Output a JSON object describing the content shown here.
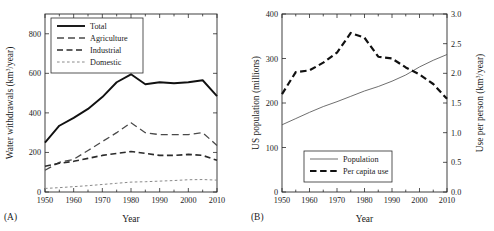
{
  "figure": {
    "panel_a_label": "(A)",
    "panel_b_label": "(B)"
  },
  "chart_data": [
    {
      "type": "line",
      "panel": "A",
      "title": "",
      "xlabel": "Year",
      "ylabel": "Water withdrawals (km3/year)",
      "ylabel_base": "Water withdrawals (km",
      "ylabel_sup": "3",
      "ylabel_tail": "/year)",
      "xlim": [
        1950,
        2010
      ],
      "ylim": [
        0,
        900
      ],
      "xticks": [
        1950,
        1960,
        1970,
        1980,
        1990,
        2000,
        2010
      ],
      "xticklabels": [
        "1950",
        "1960",
        "1970",
        "1980",
        "1990",
        "2000",
        "2010"
      ],
      "xminorticks": [
        1955,
        1965,
        1975,
        1985,
        1995,
        2005
      ],
      "yticks": [
        0,
        200,
        400,
        600,
        800
      ],
      "yticklabels": [
        "0",
        "200",
        "400",
        "600",
        "800"
      ],
      "grid": false,
      "legend_position": "upper-left",
      "x": [
        1950,
        1955,
        1960,
        1965,
        1970,
        1975,
        1980,
        1985,
        1990,
        1995,
        2000,
        2005,
        2010
      ],
      "series": [
        {
          "name": "Total",
          "style": "solid",
          "width": 1.9,
          "color": "#111111",
          "values": [
            250,
            335,
            375,
            420,
            480,
            555,
            595,
            545,
            555,
            550,
            555,
            565,
            485
          ]
        },
        {
          "name": "Agriculture",
          "style": "long-dash",
          "width": 1.3,
          "color": "#4a4a4a",
          "values": [
            110,
            150,
            165,
            210,
            255,
            300,
            350,
            300,
            290,
            290,
            290,
            300,
            235
          ]
        },
        {
          "name": "Industrial",
          "style": "medium-dash",
          "width": 1.6,
          "color": "#2b2b2b",
          "values": [
            130,
            145,
            155,
            170,
            185,
            195,
            205,
            195,
            185,
            185,
            190,
            185,
            160
          ]
        },
        {
          "name": "Domestic",
          "style": "short-dash",
          "width": 1.0,
          "color": "#8a8a8a",
          "values": [
            18,
            22,
            27,
            32,
            38,
            44,
            50,
            52,
            55,
            58,
            62,
            63,
            60
          ]
        }
      ]
    },
    {
      "type": "line",
      "panel": "B",
      "title": "",
      "xlabel": "Year",
      "ylabel": "US population (millions)",
      "y2label": "Use per person (km3/year)",
      "y2label_base": "Use per person (km",
      "y2label_sup": "3",
      "y2label_tail": "/year)",
      "xlim": [
        1950,
        2010
      ],
      "ylim": [
        0,
        400
      ],
      "y2lim": [
        0.0,
        3.0
      ],
      "xticks": [
        1950,
        1960,
        1970,
        1980,
        1990,
        2000,
        2010
      ],
      "xticklabels": [
        "1950",
        "1960",
        "1970",
        "1980",
        "1990",
        "2000",
        "2010"
      ],
      "xminorticks": [
        1955,
        1965,
        1975,
        1985,
        1995,
        2005
      ],
      "yticks": [
        0,
        100,
        200,
        300,
        400
      ],
      "yticklabels": [
        "0",
        "100",
        "200",
        "300",
        "400"
      ],
      "y2ticks": [
        0.0,
        0.5,
        1.0,
        1.5,
        2.0,
        2.5,
        3.0
      ],
      "y2ticklabels": [
        "0.0",
        "0.5",
        "1.0",
        "1.5",
        "2.0",
        "2.5",
        "3.0"
      ],
      "grid": false,
      "legend_position": "lower-left",
      "x": [
        1950,
        1955,
        1960,
        1965,
        1970,
        1975,
        1980,
        1985,
        1990,
        1995,
        2000,
        2005,
        2010
      ],
      "series": [
        {
          "name": "Population",
          "style": "solid",
          "axis": "left",
          "width": 0.85,
          "color": "#555555",
          "values": [
            151,
            165,
            179,
            192,
            203,
            215,
            227,
            237,
            249,
            263,
            281,
            296,
            309
          ]
        },
        {
          "name": "Per capita use",
          "style": "heavy-dash",
          "axis": "right",
          "width": 2.2,
          "color": "#111111",
          "values": [
            1.65,
            2.02,
            2.05,
            2.18,
            2.35,
            2.68,
            2.6,
            2.28,
            2.25,
            2.1,
            1.98,
            1.82,
            1.57
          ]
        }
      ]
    }
  ]
}
